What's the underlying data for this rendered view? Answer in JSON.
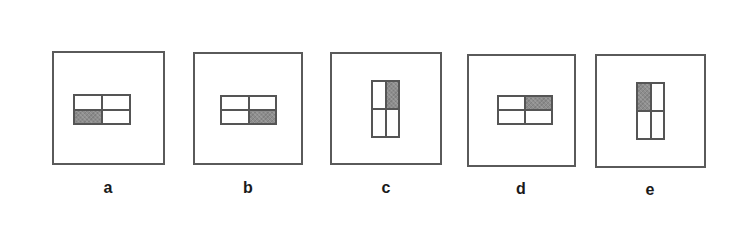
{
  "figure": {
    "panels": [
      {
        "id": "a",
        "label": "a",
        "orientation": "horizontal",
        "shaded_cell": "bottom-left",
        "frame": {
          "x": 52,
          "y": 51,
          "w": 113,
          "h": 114
        },
        "inner": {
          "x": 73,
          "y": 94,
          "w": 58,
          "h": 31
        },
        "label_pos": {
          "x": 88,
          "y": 180
        }
      },
      {
        "id": "b",
        "label": "b",
        "orientation": "horizontal",
        "shaded_cell": "bottom-right",
        "frame": {
          "x": 193,
          "y": 52,
          "w": 110,
          "h": 113
        },
        "inner": {
          "x": 220,
          "y": 95,
          "w": 57,
          "h": 30
        },
        "label_pos": {
          "x": 228,
          "y": 180
        }
      },
      {
        "id": "c",
        "label": "c",
        "orientation": "vertical",
        "shaded_cell": "top-right",
        "frame": {
          "x": 330,
          "y": 52,
          "w": 112,
          "h": 113
        },
        "inner": {
          "x": 371,
          "y": 80,
          "w": 29,
          "h": 58
        },
        "label_pos": {
          "x": 366,
          "y": 180
        }
      },
      {
        "id": "d",
        "label": "d",
        "orientation": "horizontal",
        "shaded_cell": "top-right",
        "frame": {
          "x": 467,
          "y": 54,
          "w": 109,
          "h": 113
        },
        "inner": {
          "x": 497,
          "y": 95,
          "w": 56,
          "h": 30
        },
        "label_pos": {
          "x": 501,
          "y": 181
        }
      },
      {
        "id": "e",
        "label": "e",
        "orientation": "vertical",
        "shaded_cell": "top-left",
        "frame": {
          "x": 595,
          "y": 54,
          "w": 111,
          "h": 114
        },
        "inner": {
          "x": 636,
          "y": 82,
          "w": 29,
          "h": 58
        },
        "label_pos": {
          "x": 630,
          "y": 182
        }
      }
    ],
    "colors": {
      "border": "#555555",
      "shade": "#8d8d8d",
      "background": "#ffffff",
      "label": "#1a1a1a"
    }
  }
}
